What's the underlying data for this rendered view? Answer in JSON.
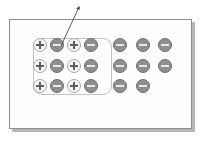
{
  "figure": {
    "background_color": "#ffffff",
    "frame": {
      "name": "material-slab",
      "border_color": "#8d8d8d",
      "fill_color": "#fdfdfd",
      "shadow_color": "#b6b6b6",
      "x": 9,
      "y": 19,
      "width": 183,
      "height": 110
    },
    "group_box": {
      "name": "highlighted-region",
      "border_color": "#c2c2c2",
      "corner_radius": 9,
      "x": 33,
      "y": 38,
      "width": 79,
      "height": 57
    },
    "pointer": {
      "name": "callout-arrow",
      "color": "#2b2b2b",
      "tail_x": 61,
      "tail_y": 46,
      "head_x": 79,
      "head_y": 7
    },
    "legend": {
      "positive_symbol": "+",
      "negative_symbol": "−",
      "positive_fill": "#f4f4f4",
      "positive_stroke": "#a9a9a9",
      "negative_fill": "#8f8f8f",
      "negative_stroke": "#6e6e6e"
    }
  },
  "chart_data": {
    "type": "scatter",
    "title": "",
    "subtitle": "",
    "xlabel": "",
    "ylabel": "",
    "xlim": [
      0,
      203
    ],
    "ylim": [
      0,
      141
    ],
    "grid": false,
    "legend_position": "none",
    "annotations": [
      {
        "name": "callout-arrow",
        "kind": "arrow",
        "from": [
          61,
          46
        ],
        "to": [
          79,
          7
        ],
        "label": ""
      }
    ],
    "series": [
      {
        "name": "positive-charges",
        "symbol": "+",
        "color": "#f4f4f4",
        "edge_color": "#a9a9a9",
        "count": 6,
        "points": [
          {
            "x": 40,
            "y": 45,
            "row": 1,
            "col": 1,
            "in_group": true
          },
          {
            "x": 74,
            "y": 45,
            "row": 1,
            "col": 3,
            "in_group": true
          },
          {
            "x": 40,
            "y": 66,
            "row": 2,
            "col": 1,
            "in_group": true
          },
          {
            "x": 74,
            "y": 66,
            "row": 2,
            "col": 3,
            "in_group": true
          },
          {
            "x": 40,
            "y": 86,
            "row": 3,
            "col": 1,
            "in_group": true
          },
          {
            "x": 74,
            "y": 86,
            "row": 3,
            "col": 3,
            "in_group": true
          }
        ]
      },
      {
        "name": "negative-charges",
        "symbol": "−",
        "color": "#8f8f8f",
        "edge_color": "#6e6e6e",
        "count": 14,
        "points": [
          {
            "x": 57,
            "y": 45,
            "row": 1,
            "col": 2,
            "in_group": true
          },
          {
            "x": 91,
            "y": 45,
            "row": 1,
            "col": 4,
            "in_group": true
          },
          {
            "x": 57,
            "y": 66,
            "row": 2,
            "col": 2,
            "in_group": true
          },
          {
            "x": 91,
            "y": 66,
            "row": 2,
            "col": 4,
            "in_group": true
          },
          {
            "x": 57,
            "y": 86,
            "row": 3,
            "col": 2,
            "in_group": true
          },
          {
            "x": 91,
            "y": 86,
            "row": 3,
            "col": 4,
            "in_group": true
          },
          {
            "x": 120,
            "y": 45,
            "row": 1,
            "col": 5,
            "in_group": false
          },
          {
            "x": 143,
            "y": 45,
            "row": 1,
            "col": 6,
            "in_group": false
          },
          {
            "x": 165,
            "y": 45,
            "row": 1,
            "col": 7,
            "in_group": false
          },
          {
            "x": 120,
            "y": 66,
            "row": 2,
            "col": 5,
            "in_group": false
          },
          {
            "x": 143,
            "y": 66,
            "row": 2,
            "col": 6,
            "in_group": false
          },
          {
            "x": 165,
            "y": 66,
            "row": 2,
            "col": 7,
            "in_group": false
          },
          {
            "x": 120,
            "y": 86,
            "row": 3,
            "col": 5,
            "in_group": false
          },
          {
            "x": 143,
            "y": 86,
            "row": 3,
            "col": 6,
            "in_group": false
          }
        ]
      }
    ]
  }
}
